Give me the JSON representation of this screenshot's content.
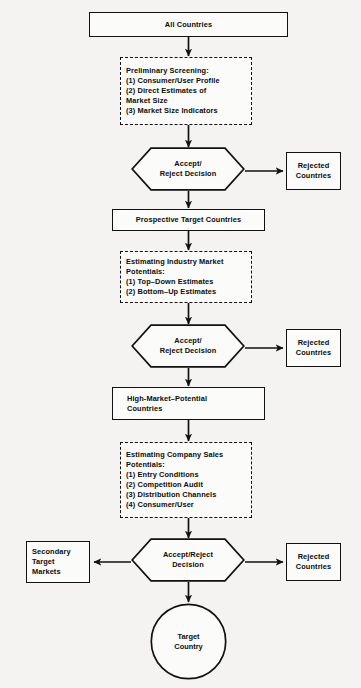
{
  "diagram": {
    "background_color": "#f4f3f1",
    "line_color": "#111111",
    "text_color": "#0b0b0b"
  },
  "nodes": {
    "all_countries": {
      "id": "all-countries",
      "shape": "rectangle",
      "label": "All Countries"
    },
    "preliminary_screening": {
      "id": "preliminary-screening",
      "shape": "dashed-rectangle",
      "heading": "Preliminary Screening:",
      "items": [
        "(1) Consumer/User Profile",
        "(2) Direct Estimates of",
        "        Market Size",
        "(3) Market Size Indicators"
      ],
      "label": "Preliminary Screening:\n(1) Consumer/User Profile\n(2) Direct Estimates of\n        Market Size\n(3) Market Size Indicators"
    },
    "decision_1": {
      "id": "accept-reject-decision-1",
      "shape": "hexagon",
      "label": "Accept/\nReject Decision"
    },
    "rejected_1": {
      "id": "rejected-countries-1",
      "shape": "rectangle",
      "label": "Rejected\nCountries"
    },
    "prospective_targets": {
      "id": "prospective-target-countries",
      "shape": "rectangle",
      "label": "Prospective Target Countries"
    },
    "industry_market_potentials": {
      "id": "estimating-industry-market-potentials",
      "shape": "dashed-rectangle",
      "heading": "Estimating Industry Market",
      "subheading": "Potentials:",
      "items": [
        "(1) Top–Down Estimates",
        "(2) Bottom–Up Estimates"
      ],
      "label": "Estimating Industry Market\nPotentials:\n(1) Top–Down Estimates\n(2) Bottom–Up Estimates"
    },
    "decision_2": {
      "id": "accept-reject-decision-2",
      "shape": "hexagon",
      "label": "Accept/\nReject Decision"
    },
    "rejected_2": {
      "id": "rejected-countries-2",
      "shape": "rectangle",
      "label": "Rejected\nCountries"
    },
    "high_market_potential": {
      "id": "high-market-potential-countries",
      "shape": "rectangle",
      "label": "High-Market–Potential\nCountries"
    },
    "company_sales_potentials": {
      "id": "estimating-company-sales-potentials",
      "shape": "dashed-rectangle",
      "heading": "Estimating Company Sales",
      "subheading": "Potentials:",
      "items": [
        "(1) Entry Conditions",
        "(2) Competition Audit",
        "(3) Distribution Channels",
        "(4) Consumer/User"
      ],
      "label": "Estimating Company Sales\nPotentials:\n(1) Entry Conditions\n(2) Competition Audit\n(3) Distribution Channels\n(4) Consumer/User"
    },
    "decision_3": {
      "id": "accept-reject-decision-3",
      "shape": "hexagon",
      "label": "Accept/Reject\nDecision"
    },
    "secondary_targets": {
      "id": "secondary-target-markets",
      "shape": "rectangle",
      "label": "Secondary\nTarget\nMarkets"
    },
    "rejected_3": {
      "id": "rejected-countries-3",
      "shape": "rectangle",
      "label": "Rejected\nCountries"
    },
    "target_country": {
      "id": "target-country",
      "shape": "circle",
      "label": "Target\nCountry"
    }
  },
  "edges": [
    {
      "from": "all_countries",
      "to": "preliminary_screening",
      "direction": "down"
    },
    {
      "from": "preliminary_screening",
      "to": "decision_1",
      "direction": "down"
    },
    {
      "from": "decision_1",
      "to": "rejected_1",
      "direction": "right"
    },
    {
      "from": "decision_1",
      "to": "prospective_targets",
      "direction": "down"
    },
    {
      "from": "prospective_targets",
      "to": "industry_market_potentials",
      "direction": "down"
    },
    {
      "from": "industry_market_potentials",
      "to": "decision_2",
      "direction": "down"
    },
    {
      "from": "decision_2",
      "to": "rejected_2",
      "direction": "right"
    },
    {
      "from": "decision_2",
      "to": "high_market_potential",
      "direction": "down"
    },
    {
      "from": "high_market_potential",
      "to": "company_sales_potentials",
      "direction": "down"
    },
    {
      "from": "company_sales_potentials",
      "to": "decision_3",
      "direction": "down"
    },
    {
      "from": "decision_3",
      "to": "secondary_targets",
      "direction": "left"
    },
    {
      "from": "decision_3",
      "to": "rejected_3",
      "direction": "right"
    },
    {
      "from": "decision_3",
      "to": "target_country",
      "direction": "down"
    }
  ]
}
